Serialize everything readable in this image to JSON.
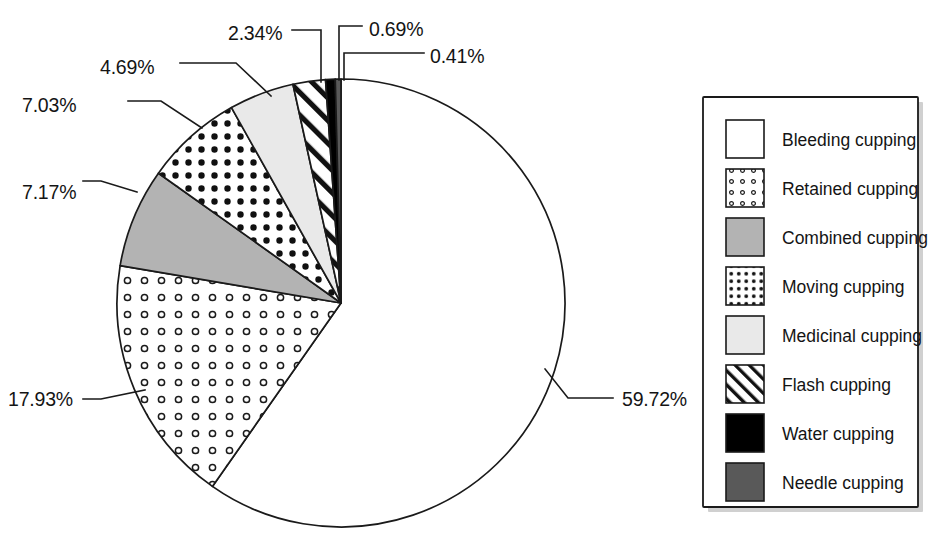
{
  "chart_data": {
    "type": "pie",
    "title": "",
    "subtitle": "",
    "xlabel": "",
    "ylabel": "",
    "legend_position": "right",
    "grid": false,
    "units": "percent",
    "start_angle_deg": 0,
    "direction": "clockwise",
    "categories": [
      "Bleeding cupping",
      "Retained cupping",
      "Combined cupping",
      "Moving cupping",
      "Medicinal cupping",
      "Flash cupping",
      "Water cupping",
      "Needle cupping"
    ],
    "values": [
      59.72,
      17.93,
      7.17,
      7.03,
      4.69,
      2.34,
      0.69,
      0.41
    ],
    "value_labels": [
      "59.72%",
      "17.93%",
      "7.17%",
      "7.03%",
      "4.69%",
      "2.34%",
      "0.69%",
      "0.41%"
    ],
    "slices": [
      {
        "label": "Bleeding cupping",
        "value": 59.72,
        "value_label": "59.72%",
        "fill_style": "solid",
        "fill_color": "#ffffff",
        "label_x": 622,
        "label_y": 406,
        "leader": "M 545,369 L 568,398 L 613,398"
      },
      {
        "label": "Retained cupping",
        "value": 17.93,
        "value_label": "17.93%",
        "fill_style": "open-dots",
        "fill_color": "#ffffff",
        "label_x": 8,
        "label_y": 406,
        "leader": "M 145,390 L 101,399 L 83,399"
      },
      {
        "label": "Combined cupping",
        "value": 7.17,
        "value_label": "7.17%",
        "fill_style": "solid",
        "fill_color": "#b3b3b3",
        "label_x": 22,
        "label_y": 199,
        "leader": "M 137,192 L 101,181 L 83,181"
      },
      {
        "label": "Moving cupping",
        "value": 7.03,
        "value_label": "7.03%",
        "fill_style": "dense-dots",
        "fill_color": "#ffffff",
        "label_x": 22,
        "label_y": 112,
        "leader": "M 202,128 L 161,101 L 128,101"
      },
      {
        "label": "Medicinal cupping",
        "value": 4.69,
        "value_label": "4.69%",
        "fill_style": "solid",
        "fill_color": "#e9e9e9",
        "label_x": 100,
        "label_y": 74,
        "leader": "M 271,96 L 236,63 L 180,63"
      },
      {
        "label": "Flash cupping",
        "value": 2.34,
        "value_label": "2.34%",
        "fill_style": "diagonal-hatch",
        "fill_color": "#ffffff",
        "label_x": 228,
        "label_y": 40,
        "leader": "M 321,82 L 321,30 L 292,30"
      },
      {
        "label": "Water cupping",
        "value": 0.69,
        "value_label": "0.69%",
        "fill_style": "solid",
        "fill_color": "#000000",
        "label_x": 369,
        "label_y": 36,
        "leader": "M 339,80 L 339,26 L 362,26"
      },
      {
        "label": "Needle cupping",
        "value": 0.41,
        "value_label": "0.41%",
        "fill_style": "solid",
        "fill_color": "#595959",
        "label_x": 430,
        "label_y": 63,
        "leader": "M 344,80 L 344,53 L 424,53"
      }
    ]
  },
  "legend": {
    "items": [
      {
        "label": "Bleeding cupping",
        "fill_style": "solid",
        "fill_color": "#ffffff"
      },
      {
        "label": "Retained cupping",
        "fill_style": "open-dots",
        "fill_color": "#ffffff"
      },
      {
        "label": "Combined cupping",
        "fill_style": "solid",
        "fill_color": "#b3b3b3"
      },
      {
        "label": "Moving cupping",
        "fill_style": "dense-dots",
        "fill_color": "#ffffff"
      },
      {
        "label": "Medicinal cupping",
        "fill_style": "solid",
        "fill_color": "#e9e9e9"
      },
      {
        "label": "Flash cupping",
        "fill_style": "diagonal-hatch",
        "fill_color": "#ffffff"
      },
      {
        "label": "Water cupping",
        "fill_style": "solid",
        "fill_color": "#000000"
      },
      {
        "label": "Needle cupping",
        "fill_style": "solid",
        "fill_color": "#595959"
      }
    ]
  },
  "colors": {
    "outline": "#1a1a1a",
    "text": "#141414",
    "background": "#ffffff",
    "combined_gray": "#b3b3b3",
    "medicinal_light_gray": "#e9e9e9",
    "needle_dark_gray": "#595959",
    "water_black": "#000000"
  }
}
